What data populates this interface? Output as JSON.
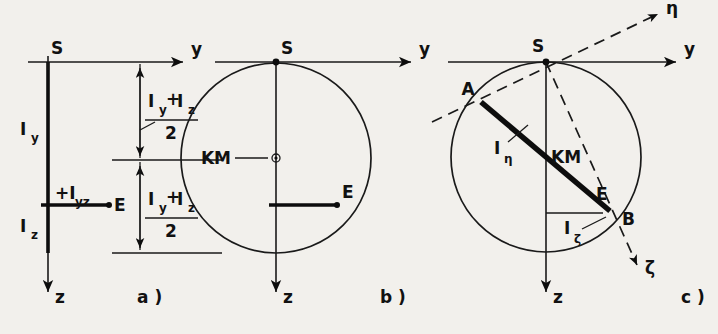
{
  "figure": {
    "background_color": "#f2f0ec",
    "ink_color": "#111111",
    "panels": [
      {
        "id": "a",
        "caption": "a )",
        "axes": {
          "horizontal": "y",
          "vertical": "z"
        },
        "points": [
          {
            "name": "S",
            "label": "S"
          },
          {
            "name": "E",
            "label": "E"
          }
        ],
        "segment_labels": [
          {
            "name": "Iy",
            "base": "I",
            "sub": "y"
          },
          {
            "name": "Iz",
            "base": "I",
            "sub": "z"
          },
          {
            "name": "Iyz",
            "base": "+I",
            "sub": "yz"
          }
        ],
        "dimensions": [
          {
            "name": "upper",
            "numerator_a": "I",
            "numerator_a_sub": "y",
            "operator": "+",
            "numerator_b": "I",
            "numerator_b_sub": "z",
            "denominator": "2"
          },
          {
            "name": "lower",
            "numerator_a": "I",
            "numerator_a_sub": "y",
            "operator": "+",
            "numerator_b": "I",
            "numerator_b_sub": "z",
            "denominator": "2"
          }
        ]
      },
      {
        "id": "b",
        "caption": "b )",
        "axes": {
          "horizontal": "y",
          "vertical": "z"
        },
        "points": [
          {
            "name": "S",
            "label": "S"
          },
          {
            "name": "KM",
            "label": "KM"
          },
          {
            "name": "E",
            "label": "E"
          }
        ]
      },
      {
        "id": "c",
        "caption": "c )",
        "axes": {
          "horizontal": "y",
          "vertical": "z",
          "principal_1": "η",
          "principal_2": "ζ"
        },
        "points": [
          {
            "name": "S",
            "label": "S"
          },
          {
            "name": "A",
            "label": "A"
          },
          {
            "name": "B",
            "label": "B"
          },
          {
            "name": "E",
            "label": "E"
          },
          {
            "name": "KM",
            "label": "KM"
          }
        ],
        "segment_labels": [
          {
            "name": "I-eta",
            "base": "I",
            "sub": "η"
          },
          {
            "name": "I-zeta",
            "base": "I",
            "sub": "ζ"
          }
        ]
      }
    ]
  }
}
